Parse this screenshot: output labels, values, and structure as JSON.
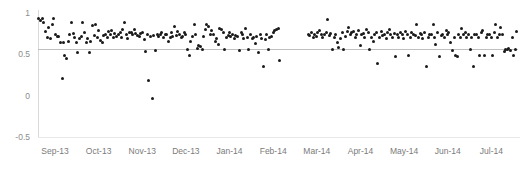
{
  "chart_data": {
    "type": "scatter",
    "title": "",
    "xlabel": "",
    "ylabel": "",
    "ylim": [
      -0.5,
      1.0
    ],
    "yticks": [
      1,
      0.5,
      0,
      -0.5
    ],
    "ytick_labels": [
      "1",
      "0.5",
      "0",
      "-0.5"
    ],
    "xtick_labels": [
      "Sep-13",
      "Oct-13",
      "Nov-13",
      "Dec-13",
      "Jan-14",
      "Feb-14",
      "Mar-14",
      "Apr-14",
      "May-14",
      "Jun-14",
      "Jul-14"
    ],
    "xtick_positions": [
      0.0,
      0.0909,
      0.1818,
      0.2727,
      0.3636,
      0.4545,
      0.5455,
      0.6364,
      0.7273,
      0.8182,
      0.9091
    ],
    "grid": false,
    "legend": null,
    "marker_color": "#1a1a1a",
    "reference_line": {
      "value": 0.565,
      "color": "#bfbfbf",
      "label": ""
    },
    "gap_ranges": [
      [
        0.505,
        0.56
      ]
    ],
    "points": [
      [
        0.002,
        0.93
      ],
      [
        0.006,
        0.905
      ],
      [
        0.01,
        0.935
      ],
      [
        0.012,
        0.88
      ],
      [
        0.016,
        0.775
      ],
      [
        0.02,
        0.7
      ],
      [
        0.022,
        0.82
      ],
      [
        0.026,
        0.69
      ],
      [
        0.03,
        0.86
      ],
      [
        0.033,
        0.93
      ],
      [
        0.036,
        0.735
      ],
      [
        0.04,
        0.72
      ],
      [
        0.043,
        0.71
      ],
      [
        0.046,
        0.64
      ],
      [
        0.05,
        0.205
      ],
      [
        0.053,
        0.64
      ],
      [
        0.056,
        0.48
      ],
      [
        0.06,
        0.455
      ],
      [
        0.063,
        0.65
      ],
      [
        0.066,
        0.735
      ],
      [
        0.07,
        0.88
      ],
      [
        0.073,
        0.755
      ],
      [
        0.076,
        0.705
      ],
      [
        0.08,
        0.64
      ],
      [
        0.083,
        0.525
      ],
      [
        0.086,
        0.69
      ],
      [
        0.09,
        0.72
      ],
      [
        0.093,
        0.88
      ],
      [
        0.096,
        0.76
      ],
      [
        0.1,
        0.64
      ],
      [
        0.104,
        0.69
      ],
      [
        0.107,
        0.52
      ],
      [
        0.11,
        0.655
      ],
      [
        0.114,
        0.845
      ],
      [
        0.117,
        0.73
      ],
      [
        0.12,
        0.86
      ],
      [
        0.124,
        0.7
      ],
      [
        0.127,
        0.785
      ],
      [
        0.13,
        0.67
      ],
      [
        0.134,
        0.64
      ],
      [
        0.137,
        0.73
      ],
      [
        0.14,
        0.745
      ],
      [
        0.144,
        0.7
      ],
      [
        0.147,
        0.775
      ],
      [
        0.15,
        0.74
      ],
      [
        0.154,
        0.79
      ],
      [
        0.157,
        0.705
      ],
      [
        0.16,
        0.755
      ],
      [
        0.164,
        0.715
      ],
      [
        0.167,
        0.745
      ],
      [
        0.171,
        0.76
      ],
      [
        0.174,
        0.7
      ],
      [
        0.177,
        0.805
      ],
      [
        0.181,
        0.885
      ],
      [
        0.184,
        0.745
      ],
      [
        0.187,
        0.695
      ],
      [
        0.191,
        0.77
      ],
      [
        0.194,
        0.76
      ],
      [
        0.197,
        0.74
      ],
      [
        0.201,
        0.8
      ],
      [
        0.204,
        0.75
      ],
      [
        0.208,
        0.73
      ],
      [
        0.211,
        0.72
      ],
      [
        0.214,
        0.755
      ],
      [
        0.218,
        0.77
      ],
      [
        0.221,
        0.68
      ],
      [
        0.224,
        0.535
      ],
      [
        0.228,
        0.735
      ],
      [
        0.231,
        0.185
      ],
      [
        0.234,
        0.715
      ],
      [
        0.238,
        -0.03
      ],
      [
        0.241,
        0.725
      ],
      [
        0.244,
        0.545
      ],
      [
        0.248,
        0.74
      ],
      [
        0.251,
        0.72
      ],
      [
        0.255,
        0.735
      ],
      [
        0.258,
        0.76
      ],
      [
        0.261,
        0.7
      ],
      [
        0.265,
        0.745
      ],
      [
        0.268,
        0.735
      ],
      [
        0.271,
        0.66
      ],
      [
        0.275,
        0.7
      ],
      [
        0.278,
        0.76
      ],
      [
        0.281,
        0.72
      ],
      [
        0.285,
        0.84
      ],
      [
        0.288,
        0.73
      ],
      [
        0.291,
        0.775
      ],
      [
        0.295,
        0.745
      ],
      [
        0.298,
        0.705
      ],
      [
        0.302,
        0.715
      ],
      [
        0.305,
        0.76
      ],
      [
        0.308,
        0.735
      ],
      [
        0.312,
        0.555
      ],
      [
        0.315,
        0.49
      ],
      [
        0.318,
        0.655
      ],
      [
        0.322,
        0.72
      ],
      [
        0.325,
        0.865
      ],
      [
        0.328,
        0.735
      ],
      [
        0.332,
        0.575
      ],
      [
        0.335,
        0.61
      ],
      [
        0.339,
        0.59
      ],
      [
        0.342,
        0.56
      ],
      [
        0.345,
        0.71
      ],
      [
        0.349,
        0.805
      ],
      [
        0.352,
        0.855
      ],
      [
        0.355,
        0.84
      ],
      [
        0.359,
        0.735
      ],
      [
        0.362,
        0.785
      ],
      [
        0.365,
        0.74
      ],
      [
        0.369,
        0.655
      ],
      [
        0.372,
        0.695
      ],
      [
        0.375,
        0.62
      ],
      [
        0.379,
        0.81
      ],
      [
        0.382,
        0.8
      ],
      [
        0.386,
        0.76
      ],
      [
        0.389,
        0.555
      ],
      [
        0.392,
        0.7
      ],
      [
        0.396,
        0.73
      ],
      [
        0.399,
        0.77
      ],
      [
        0.402,
        0.71
      ],
      [
        0.406,
        0.745
      ],
      [
        0.409,
        0.69
      ],
      [
        0.412,
        0.725
      ],
      [
        0.416,
        0.715
      ],
      [
        0.419,
        0.545
      ],
      [
        0.423,
        0.76
      ],
      [
        0.426,
        0.735
      ],
      [
        0.429,
        0.69
      ],
      [
        0.433,
        0.815
      ],
      [
        0.436,
        0.705
      ],
      [
        0.439,
        0.555
      ],
      [
        0.443,
        0.745
      ],
      [
        0.446,
        0.69
      ],
      [
        0.449,
        0.7
      ],
      [
        0.453,
        0.63
      ],
      [
        0.456,
        0.71
      ],
      [
        0.459,
        0.52
      ],
      [
        0.463,
        0.735
      ],
      [
        0.466,
        0.69
      ],
      [
        0.47,
        0.355
      ],
      [
        0.473,
        0.68
      ],
      [
        0.476,
        0.745
      ],
      [
        0.48,
        0.555
      ],
      [
        0.483,
        0.7
      ],
      [
        0.486,
        0.72
      ],
      [
        0.49,
        0.76
      ],
      [
        0.493,
        0.79
      ],
      [
        0.496,
        0.8
      ],
      [
        0.5,
        0.81
      ],
      [
        0.503,
        0.43
      ],
      [
        0.563,
        0.745
      ],
      [
        0.566,
        0.73
      ],
      [
        0.57,
        0.76
      ],
      [
        0.573,
        0.7
      ],
      [
        0.577,
        0.735
      ],
      [
        0.58,
        0.715
      ],
      [
        0.583,
        0.76
      ],
      [
        0.587,
        0.79
      ],
      [
        0.59,
        0.745
      ],
      [
        0.593,
        0.7
      ],
      [
        0.597,
        0.735
      ],
      [
        0.6,
        0.76
      ],
      [
        0.604,
        0.92
      ],
      [
        0.607,
        0.73
      ],
      [
        0.61,
        0.755
      ],
      [
        0.614,
        0.56
      ],
      [
        0.617,
        0.7
      ],
      [
        0.62,
        0.745
      ],
      [
        0.624,
        0.64
      ],
      [
        0.627,
        0.58
      ],
      [
        0.63,
        0.69
      ],
      [
        0.634,
        0.76
      ],
      [
        0.637,
        0.555
      ],
      [
        0.641,
        0.72
      ],
      [
        0.644,
        0.78
      ],
      [
        0.647,
        0.83
      ],
      [
        0.651,
        0.735
      ],
      [
        0.654,
        0.76
      ],
      [
        0.657,
        0.775
      ],
      [
        0.661,
        0.7
      ],
      [
        0.664,
        0.745
      ],
      [
        0.668,
        0.79
      ],
      [
        0.671,
        0.61
      ],
      [
        0.674,
        0.735
      ],
      [
        0.678,
        0.755
      ],
      [
        0.681,
        0.7
      ],
      [
        0.684,
        0.805
      ],
      [
        0.688,
        0.76
      ],
      [
        0.691,
        0.555
      ],
      [
        0.695,
        0.7
      ],
      [
        0.698,
        0.65
      ],
      [
        0.701,
        0.735
      ],
      [
        0.705,
        0.76
      ],
      [
        0.708,
        0.385
      ],
      [
        0.711,
        0.7
      ],
      [
        0.715,
        0.775
      ],
      [
        0.718,
        0.73
      ],
      [
        0.722,
        0.745
      ],
      [
        0.725,
        0.69
      ],
      [
        0.728,
        0.76
      ],
      [
        0.732,
        0.8
      ],
      [
        0.735,
        0.735
      ],
      [
        0.738,
        0.7
      ],
      [
        0.742,
        0.755
      ],
      [
        0.745,
        0.47
      ],
      [
        0.749,
        0.735
      ],
      [
        0.752,
        0.7
      ],
      [
        0.755,
        0.76
      ],
      [
        0.759,
        0.745
      ],
      [
        0.762,
        0.69
      ],
      [
        0.765,
        0.78
      ],
      [
        0.769,
        0.735
      ],
      [
        0.772,
        0.49
      ],
      [
        0.775,
        0.7
      ],
      [
        0.779,
        0.76
      ],
      [
        0.782,
        0.745
      ],
      [
        0.786,
        0.73
      ],
      [
        0.789,
        0.86
      ],
      [
        0.792,
        0.7
      ],
      [
        0.796,
        0.755
      ],
      [
        0.799,
        0.735
      ],
      [
        0.802,
        0.69
      ],
      [
        0.806,
        0.76
      ],
      [
        0.809,
        0.35
      ],
      [
        0.813,
        0.7
      ],
      [
        0.816,
        0.745
      ],
      [
        0.819,
        0.735
      ],
      [
        0.823,
        0.86
      ],
      [
        0.826,
        0.7
      ],
      [
        0.829,
        0.62
      ],
      [
        0.833,
        0.76
      ],
      [
        0.836,
        0.47
      ],
      [
        0.84,
        0.73
      ],
      [
        0.843,
        0.745
      ],
      [
        0.846,
        0.7
      ],
      [
        0.85,
        0.79
      ],
      [
        0.853,
        0.735
      ],
      [
        0.856,
        0.76
      ],
      [
        0.86,
        0.64
      ],
      [
        0.863,
        0.545
      ],
      [
        0.867,
        0.7
      ],
      [
        0.87,
        0.49
      ],
      [
        0.873,
        0.475
      ],
      [
        0.877,
        0.735
      ],
      [
        0.88,
        0.7
      ],
      [
        0.883,
        0.81
      ],
      [
        0.887,
        0.745
      ],
      [
        0.89,
        0.76
      ],
      [
        0.893,
        0.7
      ],
      [
        0.897,
        0.735
      ],
      [
        0.9,
        0.56
      ],
      [
        0.904,
        0.7
      ],
      [
        0.907,
        0.355
      ],
      [
        0.91,
        0.745
      ],
      [
        0.914,
        0.735
      ],
      [
        0.917,
        0.7
      ],
      [
        0.92,
        0.49
      ],
      [
        0.924,
        0.76
      ],
      [
        0.927,
        0.79
      ],
      [
        0.93,
        0.48
      ],
      [
        0.934,
        0.7
      ],
      [
        0.937,
        0.735
      ],
      [
        0.941,
        0.745
      ],
      [
        0.944,
        0.7
      ],
      [
        0.947,
        0.48
      ],
      [
        0.951,
        0.76
      ],
      [
        0.954,
        0.86
      ],
      [
        0.957,
        0.7
      ],
      [
        0.961,
        0.735
      ],
      [
        0.964,
        0.82
      ],
      [
        0.968,
        0.745
      ],
      [
        0.971,
        0.53
      ],
      [
        0.974,
        0.56
      ],
      [
        0.978,
        0.555
      ],
      [
        0.981,
        0.565
      ],
      [
        0.984,
        0.545
      ],
      [
        0.988,
        0.7
      ],
      [
        0.991,
        0.49
      ],
      [
        0.994,
        0.56
      ],
      [
        0.997,
        0.78
      ]
    ]
  }
}
